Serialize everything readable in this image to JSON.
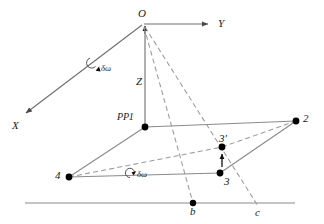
{
  "figure": {
    "type": "technical-line-diagram",
    "background_color": "#ffffff",
    "line_color": "#808080",
    "dashed_color": "#909090",
    "node_color": "#000000",
    "text_color": "#1a1a1a",
    "width": 324,
    "height": 224
  },
  "axes": {
    "origin_label": "O",
    "y_axis_label": "Y",
    "x_axis_label": "X",
    "z_axis_label": "Z"
  },
  "labels": {
    "principal_point": "PP1",
    "rotation_upper": "δω",
    "rotation_lower": "δω",
    "point_2": "2",
    "point_3": "3",
    "point_3_prime": "3'",
    "point_4": "4",
    "point_b": "b",
    "point_c": "c"
  },
  "geometry": {
    "nodes": [
      {
        "name": "O",
        "x": 143,
        "y": 24,
        "dot": false
      },
      {
        "name": "PP1",
        "x": 145,
        "y": 127,
        "dot": true
      },
      {
        "name": "2",
        "x": 296,
        "y": 121,
        "dot": true
      },
      {
        "name": "3",
        "x": 220,
        "y": 173,
        "dot": true
      },
      {
        "name": "3'",
        "x": 222,
        "y": 147,
        "dot": true
      },
      {
        "name": "4",
        "x": 69,
        "y": 177,
        "dot": true
      },
      {
        "name": "b",
        "x": 193,
        "y": 203,
        "dot": true
      }
    ],
    "solid_edges": [
      {
        "from": "O",
        "to": "Y-arrow"
      },
      {
        "from": "O",
        "to": "X-arrow"
      },
      {
        "from": "O",
        "to": "PP1"
      },
      {
        "from": "PP1",
        "to": "2"
      },
      {
        "from": "PP1",
        "to": "4"
      },
      {
        "from": "4",
        "to": "3"
      },
      {
        "from": "3",
        "to": "2"
      },
      {
        "from": "ground-left",
        "to": "ground-right"
      }
    ],
    "dashed_edges": [
      {
        "from": "O",
        "to": "b"
      },
      {
        "from": "O",
        "to": "c"
      },
      {
        "from": "4",
        "to": "3'"
      },
      {
        "from": "3'",
        "to": "2"
      }
    ],
    "ground_line": {
      "x1": 25,
      "y1": 203,
      "x2": 295,
      "y2": 203
    },
    "displacement_arrow": {
      "x": 222,
      "from_y": 166,
      "to_y": 155
    }
  }
}
